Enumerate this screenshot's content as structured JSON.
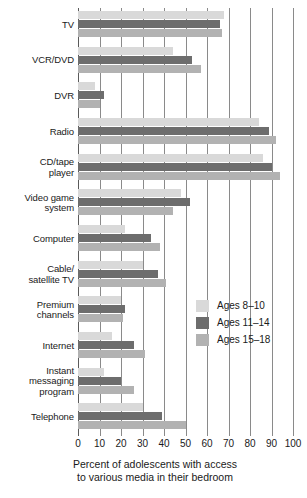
{
  "chart_data": {
    "type": "bar",
    "orientation": "horizontal",
    "title": "",
    "xlabel": "Percent of adolescents with access to various media in their bedroom",
    "ylabel": "",
    "xlim": [
      0,
      100
    ],
    "xticks": [
      0,
      10,
      20,
      30,
      40,
      50,
      60,
      70,
      80,
      90,
      100
    ],
    "grid": true,
    "legend_position": "middle-right",
    "categories": [
      "TV",
      "VCR/DVD",
      "DVR",
      "Radio",
      "CD/tape player",
      "Video game system",
      "Computer",
      "Cable/ satellite TV",
      "Premium channels",
      "Internet",
      "Instant messaging program",
      "Telephone"
    ],
    "series": [
      {
        "name": "Ages 8–10",
        "color": "#d9d9d9",
        "values": [
          68,
          44,
          8,
          84,
          86,
          48,
          22,
          30,
          20,
          16,
          12,
          30
        ]
      },
      {
        "name": "Ages 11–14",
        "color": "#6d6d6d",
        "values": [
          66,
          53,
          12,
          89,
          90,
          52,
          34,
          37,
          22,
          26,
          20,
          39
        ]
      },
      {
        "name": "Ages 15–18",
        "color": "#b2b2b2",
        "values": [
          67,
          57,
          10,
          92,
          94,
          44,
          38,
          41,
          21,
          31,
          26,
          50
        ]
      }
    ]
  },
  "axis": {
    "tick_labels": [
      "0",
      "10",
      "20",
      "30",
      "40",
      "50",
      "60",
      "70",
      "80",
      "90",
      "100"
    ],
    "caption_line1": "Percent of adolescents with access",
    "caption_line2": "to various media in their bedroom"
  },
  "legend": {
    "items": [
      {
        "label": "Ages 8–10",
        "color": "#d9d9d9"
      },
      {
        "label": "Ages 11–14",
        "color": "#6d6d6d"
      },
      {
        "label": "Ages 15–18",
        "color": "#b2b2b2"
      }
    ]
  },
  "category_labels": [
    {
      "lines": [
        "TV"
      ]
    },
    {
      "lines": [
        "VCR/DVD"
      ]
    },
    {
      "lines": [
        "DVR"
      ]
    },
    {
      "lines": [
        "Radio"
      ]
    },
    {
      "lines": [
        "CD/tape",
        "player"
      ]
    },
    {
      "lines": [
        "Video game",
        "system"
      ]
    },
    {
      "lines": [
        "Computer"
      ]
    },
    {
      "lines": [
        "Cable/",
        "satellite TV"
      ]
    },
    {
      "lines": [
        "Premium",
        "channels"
      ]
    },
    {
      "lines": [
        "Internet"
      ]
    },
    {
      "lines": [
        "Instant",
        "messaging",
        "program"
      ]
    },
    {
      "lines": [
        "Telephone"
      ]
    }
  ]
}
